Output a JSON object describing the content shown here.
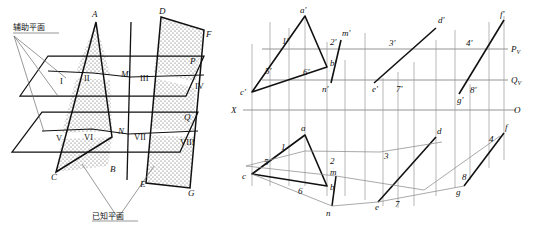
{
  "page": {
    "top_partial_text": ""
  },
  "pictorial": {
    "annotations": {
      "auxiliary_plane": "辅助平面",
      "given_plane": "已知平面"
    },
    "plane_labels": [
      {
        "id": "P",
        "text": "P"
      },
      {
        "id": "Q",
        "text": "Q"
      }
    ],
    "vertex_labels": [
      {
        "id": "A",
        "text": "A"
      },
      {
        "id": "B",
        "text": "B"
      },
      {
        "id": "C",
        "text": "C"
      },
      {
        "id": "D",
        "text": "D"
      },
      {
        "id": "E",
        "text": "E"
      },
      {
        "id": "F",
        "text": "F"
      },
      {
        "id": "G",
        "text": "G"
      },
      {
        "id": "M",
        "text": "M"
      },
      {
        "id": "N",
        "text": "N"
      }
    ],
    "roman_labels": [
      {
        "id": "I",
        "text": "I"
      },
      {
        "id": "II",
        "text": "II"
      },
      {
        "id": "III",
        "text": "III"
      },
      {
        "id": "IV",
        "text": "IV"
      },
      {
        "id": "V",
        "text": "V"
      },
      {
        "id": "VI",
        "text": "VI"
      },
      {
        "id": "VII",
        "text": "VII"
      },
      {
        "id": "VIII",
        "text": "VIII"
      }
    ]
  },
  "projection": {
    "axes": [
      {
        "id": "Pv",
        "name": "P",
        "sub": "V"
      },
      {
        "id": "Qv",
        "name": "Q",
        "sub": "V"
      },
      {
        "id": "O",
        "name": "O",
        "sub": ""
      },
      {
        "id": "X",
        "name": "X",
        "sub": ""
      }
    ],
    "front_view_labels": [
      {
        "id": "a1",
        "text": "a'"
      },
      {
        "id": "b1",
        "text": "b'"
      },
      {
        "id": "c1",
        "text": "c'"
      },
      {
        "id": "d1",
        "text": "d'"
      },
      {
        "id": "e1",
        "text": "e'"
      },
      {
        "id": "f1",
        "text": "f'"
      },
      {
        "id": "g1",
        "text": "g'"
      },
      {
        "id": "m1",
        "text": "m'"
      },
      {
        "id": "n1",
        "text": "n'"
      },
      {
        "id": "p1",
        "text": "1'"
      },
      {
        "id": "p2",
        "text": "2'"
      },
      {
        "id": "p3",
        "text": "3'"
      },
      {
        "id": "p4",
        "text": "4'"
      },
      {
        "id": "p5",
        "text": "5'"
      },
      {
        "id": "p6",
        "text": "6'"
      },
      {
        "id": "p7",
        "text": "7'"
      },
      {
        "id": "p8",
        "text": "8'"
      }
    ],
    "top_view_labels": [
      {
        "id": "a",
        "text": "a"
      },
      {
        "id": "b",
        "text": "b"
      },
      {
        "id": "c",
        "text": "c"
      },
      {
        "id": "d",
        "text": "d"
      },
      {
        "id": "e",
        "text": "e"
      },
      {
        "id": "f",
        "text": "f"
      },
      {
        "id": "g",
        "text": "g"
      },
      {
        "id": "m",
        "text": "m"
      },
      {
        "id": "n",
        "text": "n"
      },
      {
        "id": "t1",
        "text": "1"
      },
      {
        "id": "t2",
        "text": "2"
      },
      {
        "id": "t3",
        "text": "3"
      },
      {
        "id": "t4",
        "text": "4"
      },
      {
        "id": "t5",
        "text": "5"
      },
      {
        "id": "t6",
        "text": "6"
      },
      {
        "id": "t7",
        "text": "7"
      },
      {
        "id": "t8",
        "text": "8"
      }
    ]
  },
  "colors": {
    "ink": "#111111",
    "thin": "#6b6b6b",
    "stipple": "#444444",
    "paper": "#ffffff"
  }
}
